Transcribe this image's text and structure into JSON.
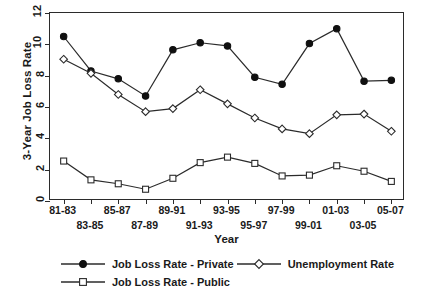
{
  "chart_data": {
    "type": "line",
    "title": "",
    "xlabel": "Year",
    "ylabel": "3-Year Job Loss Rate",
    "categories": [
      "81-83",
      "83-85",
      "85-87",
      "87-89",
      "89-91",
      "91-93",
      "93-95",
      "95-97",
      "97-99",
      "99-01",
      "01-03",
      "03-05",
      "05-07"
    ],
    "ylim": [
      0,
      12
    ],
    "yticks": [
      0,
      2,
      4,
      6,
      8,
      10,
      12
    ],
    "grid": false,
    "legend_position": "bottom",
    "series": [
      {
        "name": "Job Loss Rate  -  Private",
        "marker": "filled-circle",
        "values": [
          10.5,
          8.3,
          7.8,
          6.7,
          9.65,
          10.1,
          9.9,
          7.9,
          7.45,
          10.05,
          11.0,
          7.65,
          7.7
        ]
      },
      {
        "name": "Unemployment Rate",
        "marker": "open-diamond",
        "values": [
          9.05,
          8.15,
          6.8,
          5.7,
          5.9,
          7.1,
          6.2,
          5.3,
          4.6,
          4.3,
          5.5,
          5.55,
          4.45
        ]
      },
      {
        "name": "Job Loss Rate  -  Public",
        "marker": "open-square",
        "values": [
          2.55,
          1.35,
          1.1,
          0.75,
          1.45,
          2.45,
          2.8,
          2.4,
          1.6,
          1.65,
          2.25,
          1.9,
          1.25
        ]
      }
    ]
  },
  "axis": {
    "ytick_labels": [
      "0",
      "2",
      "4",
      "6",
      "8",
      "10",
      "12"
    ],
    "xtick_labels": [
      "81-83",
      "83-85",
      "85-87",
      "87-89",
      "89-91",
      "91-93",
      "93-95",
      "95-97",
      "97-99",
      "99-01",
      "01-03",
      "03-05",
      "05-07"
    ],
    "y_title": "3-Year Job Loss Rate",
    "x_title": "Year"
  },
  "legend": {
    "items": [
      {
        "label": "Job Loss Rate  -  Private",
        "marker": "filled-circle"
      },
      {
        "label": "Unemployment Rate",
        "marker": "open-diamond"
      },
      {
        "label": "Job Loss Rate  -  Public",
        "marker": "open-square"
      }
    ]
  },
  "colors": {
    "line": "#2b2b2b",
    "marker_fill": "#ffffff",
    "marker_fill_solid": "#101010",
    "axis": "#2b2b2b",
    "background": "#ffffff"
  }
}
